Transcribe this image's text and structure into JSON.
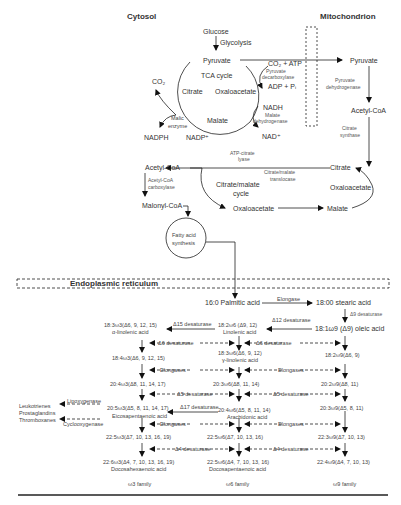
{
  "regions": {
    "cytosol": "Cytosol",
    "mitochondrion": "Mitochondrion",
    "er": "Endoplasmic reticulum"
  },
  "cytosol": {
    "glucose": "Glucose",
    "glycolysis": "Glycolysis",
    "pyruvate": "Pyruvate",
    "tca_cycle": "TCA cycle",
    "citrate": "Citrate",
    "oxaloacetate": "Oxaloacetate",
    "malate": "Malate",
    "co2": "CO₂",
    "malic_enzyme_1": "Malic",
    "malic_enzyme_2": "enzyme",
    "nadph": "NADPH",
    "nadp": "NADP⁺",
    "co2_atp": "CO₂ + ATP",
    "pyruvate_decarboxylase_1": "Pyruvate",
    "pyruvate_decarboxylase_2": "decarboxylase",
    "adp_pi": "ADP + Pᵢ",
    "nadh": "NADH",
    "malate_dh_1": "Malate",
    "malate_dh_2": "dehydrogenase",
    "nad": "NAD⁺",
    "atp_citrate_lyase_1": "ATP-citrate",
    "atp_citrate_lyase_2": "lyase",
    "acetyl_coa": "Acetyl-CoA",
    "acc_1": "Acetyl-CoA",
    "acc_2": "carboxylase",
    "malonyl_coa": "Malonyl-CoA",
    "citrate_malate_cycle_1": "Citrate/malate",
    "citrate_malate_cycle_2": "cycle",
    "oxaloacetate2": "Oxaloacetate",
    "translocase_1": "Citrate/malate",
    "translocase_2": "translocase",
    "fas_1": "Fatty acid",
    "fas_2": "synthesis"
  },
  "mito": {
    "pyruvate": "Pyruvate",
    "pdh_1": "Pyruvate",
    "pdh_2": "dehydrogenase",
    "acetyl_coa": "Acetyl-CoA",
    "cs_1": "Citrate",
    "cs_2": "synthase",
    "citrate": "Citrate",
    "oxaloacetate": "Oxaloacetate",
    "malate": "Malate"
  },
  "er": {
    "palmitic": "16:0 Palmitic acid",
    "elongase": "Elongase",
    "stearic": "18:00 stearic acid",
    "d9_desaturase": "Δ9 desaturase",
    "oleic": "18:1ω9 (Δ9) oleic acid",
    "d12_desaturase": "Δ12 desaturase",
    "linoleic_1": "18:2ω6 (Δ9, 12)",
    "linoleic_2": "Linolenic acid",
    "d15_desaturase": "Δ15 desaturase",
    "alinolenic_1": "18:3ω3(Δ6, 9, 12, 15)",
    "alinolenic_2": "α-linolenic acid",
    "d6_desaturase": "Δ6 desaturase",
    "w3_184": "18:4ω3(Δ6, 9, 12, 15)",
    "w6_183_1": "18:3ω6(Δ6, 9, 12)",
    "w6_183_2": "γ-linolenic acid",
    "w9_182": "18:2ω9(Δ6, 9)",
    "elongases": "Elongases",
    "w3_204": "20:4ω3(Δ8, 11, 14, 17)",
    "w6_203": "20:3ω6(Δ8, 11, 14)",
    "w9_202": "20:2ω9(Δ8, 11)",
    "d5_desaturase": "Δ5 desaturase",
    "d17_desaturase": "Δ17 desaturase",
    "w3_205_1": "20:5ω3(Δ5, 8, 11, 14, 17)",
    "w3_205_2": "Eicosapentaenoic acid",
    "w6_204_1": "20:4ω6(Δ5, 8, 11, 14)",
    "w6_204_2": "Arachidonic acid",
    "w9_203": "20:3ω9(Δ5, 8, 11)",
    "lipoxygenase": "Lipoxygenase",
    "cyclooxygenase": "Cyclooxygenase",
    "leukotrienes": "Leukotrienes",
    "prostaglandins": "Prostaglandins",
    "thromboxanes": "Thromboxanes",
    "w3_225": "22:5ω3(Δ7, 10, 13, 16, 19)",
    "w6_225": "22:5ω6(Δ7, 10, 13, 16)",
    "w9_223": "22:3ω9(Δ7, 10, 13)",
    "d4_desaturase": "Δ4 desaturase",
    "w3_226_1": "22:6ω3(Δ4, 7, 10, 13, 16, 19)",
    "w3_226_2": "Docosahexaenoic acid",
    "w6_225b_1": "22:5ω6(Δ4, 7, 10, 13, 16)",
    "w6_225b_2": "Docosapentaenoic acid",
    "w9_224": "22:4ω9(Δ4, 7, 10, 13)",
    "w3_family": "ω3 family",
    "w6_family": "ω6 family",
    "w9_family": "ω9 family"
  }
}
